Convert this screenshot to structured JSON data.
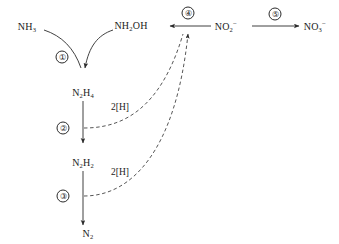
{
  "diagram": {
    "stroke_color": "#2b2b2b",
    "text_color": "#1a1a1a",
    "background_color": "#ffffff",
    "species": [
      {
        "id": "ammonia",
        "html": "NH<sub>3</sub>",
        "x": 27,
        "y": 26
      },
      {
        "id": "hydroxylamine",
        "html": "NH<sub>2</sub>OH",
        "x": 131,
        "y": 25
      },
      {
        "id": "hydrazine",
        "html": "N<sub>2</sub>H<sub>4</sub>",
        "x": 83,
        "y": 92
      },
      {
        "id": "diimide",
        "html": "N<sub>2</sub>H<sub>2</sub>",
        "x": 83,
        "y": 162
      },
      {
        "id": "dinitrogen",
        "html": "N<sub>2</sub>",
        "x": 88,
        "y": 233
      },
      {
        "id": "nitrite",
        "html": "NO<sub>2</sub><sup>&#8722;</sup>",
        "x": 226,
        "y": 26
      },
      {
        "id": "nitrate",
        "html": "NO<sub>3</sub><sup>&#8722;</sup>",
        "x": 315,
        "y": 26
      }
    ],
    "cofactors": [
      {
        "id": "reductant-upper",
        "label": "2[H]",
        "x": 120,
        "y": 107
      },
      {
        "id": "reductant-lower",
        "label": "2[H]",
        "x": 120,
        "y": 172
      }
    ],
    "steps": [
      {
        "id": "step-1",
        "label": "①",
        "x": 62,
        "y": 57
      },
      {
        "id": "step-2",
        "label": "②",
        "x": 63,
        "y": 128
      },
      {
        "id": "step-3",
        "label": "③",
        "x": 63,
        "y": 196
      },
      {
        "id": "step-4",
        "label": "④",
        "x": 188,
        "y": 13
      },
      {
        "id": "step-5",
        "label": "⑤",
        "x": 275,
        "y": 14
      }
    ]
  }
}
